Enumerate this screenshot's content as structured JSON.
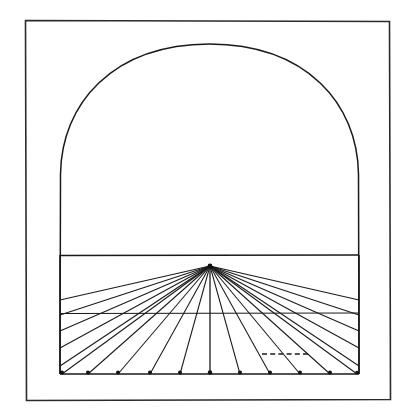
{
  "figure": {
    "title": "One-point perspective grid inside an arched picture plane",
    "medium": "ink line drawing",
    "background_color": "#ffffff",
    "ink_color": "#1a1a1a",
    "canvas": {
      "width": 416,
      "height": 416
    }
  },
  "chart_data": {
    "type": "line",
    "title": "One-point perspective grid inside an arched picture plane",
    "xlabel": "",
    "ylabel": "",
    "xlim": [
      0,
      416
    ],
    "ylim": [
      0,
      416
    ],
    "grid": false,
    "legend": "none",
    "outer_frame": {
      "x": 25,
      "y": 20,
      "width": 365,
      "height": 380
    },
    "arch": {
      "left_x": 60,
      "right_x": 359,
      "spring_y": 172,
      "apex_y": 44,
      "base_y": 374,
      "shape": "semicircular arch on vertical jambs"
    },
    "horizon_line": {
      "y": 255,
      "x1": 60,
      "x2": 359
    },
    "transversal_line": {
      "y": 313,
      "x1": 60,
      "x2": 359
    },
    "base_line": {
      "y": 374,
      "x1": 60,
      "x2": 359
    },
    "vanishing_point": {
      "x": 210,
      "y": 266
    },
    "dashed_measure_segment": {
      "x1": 262,
      "x2": 309,
      "y": 354
    },
    "station_points_x": [
      62,
      88,
      118,
      150,
      180,
      210,
      240,
      270,
      300,
      330,
      357
    ],
    "station_points_y": 374,
    "left_edge_exit_points_y": [
      300,
      315,
      331,
      348,
      366
    ],
    "right_edge_exit_points_y": [
      300,
      315,
      331,
      348,
      366
    ],
    "ray_count_total": 21,
    "ray_count_to_base": 11,
    "ray_count_to_left_wall": 5,
    "ray_count_to_right_wall": 5,
    "series": [
      {
        "name": "orthogonals-to-base",
        "values": [
          62,
          88,
          118,
          150,
          180,
          210,
          240,
          270,
          300,
          330,
          357
        ]
      },
      {
        "name": "orthogonals-to-left-wall",
        "values": [
          300,
          315,
          331,
          348,
          366
        ]
      },
      {
        "name": "orthogonals-to-right-wall",
        "values": [
          300,
          315,
          331,
          348,
          366
        ]
      }
    ]
  },
  "elements": {
    "outer_frame_label": "outer border",
    "arch_label": "arched picture plane",
    "horizon_label": "horizon line",
    "transversal_label": "transversal line",
    "base_label": "base line",
    "vanishing_point_label": "vanishing point",
    "dashed_label": "dashed measuring segment"
  }
}
